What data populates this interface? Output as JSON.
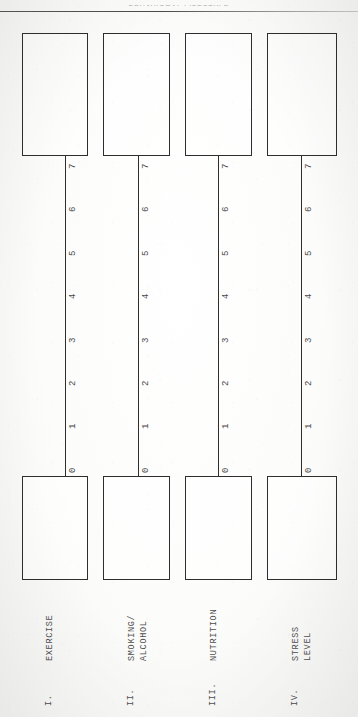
{
  "document": {
    "header_partial_text": "BEHAVIORAL LIFESTYLE",
    "page_background": "#fbfbfa",
    "ink_color": "#2e2e2e"
  },
  "scale": {
    "max": 7,
    "min": 0,
    "tick_labels": [
      "7",
      "6",
      "5",
      "4",
      "3",
      "2",
      "1",
      "0"
    ],
    "orientation": "vertical-descending"
  },
  "columns": [
    {
      "numeral": "I.",
      "label_line1": "EXERCISE",
      "label_line2": "",
      "top_box_value": "",
      "bottom_box_value": "",
      "tick_labels": [
        "7",
        "6",
        "5",
        "4",
        "3",
        "2",
        "1",
        "0"
      ]
    },
    {
      "numeral": "II.",
      "label_line1": "SMOKING/",
      "label_line2": "ALCOHOL",
      "top_box_value": "",
      "bottom_box_value": "",
      "tick_labels": [
        "7",
        "6",
        "5",
        "4",
        "3",
        "2",
        "1",
        "0"
      ]
    },
    {
      "numeral": "III.",
      "label_line1": "NUTRITION",
      "label_line2": "",
      "top_box_value": "",
      "bottom_box_value": "",
      "tick_labels": [
        "7",
        "6",
        "5",
        "4",
        "3",
        "2",
        "1",
        "0"
      ]
    },
    {
      "numeral": "IV.",
      "label_line1": "STRESS",
      "label_line2": "LEVEL",
      "top_box_value": "",
      "bottom_box_value": "",
      "tick_labels": [
        "7",
        "6",
        "5",
        "4",
        "3",
        "2",
        "1",
        "0"
      ]
    }
  ]
}
